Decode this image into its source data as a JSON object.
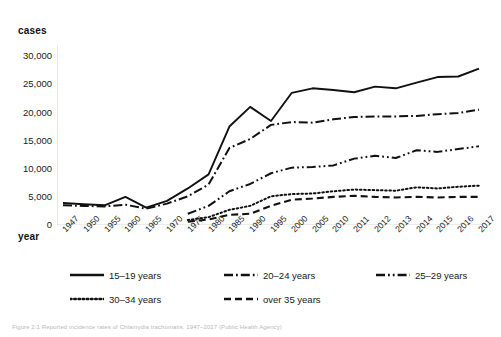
{
  "figure": {
    "caption": "Figure 2.1 Reported incidence rates of Chlamydia trachomatis, 1947–2017 (Public Health Agency)"
  },
  "axes": {
    "y_title": "cases",
    "x_title": "year",
    "y_ticks": [
      "30,000",
      "25,000",
      "20,000",
      "15,000",
      "10,000",
      "5,000",
      "0"
    ],
    "x_ticks": [
      "1947",
      "1950",
      "1955",
      "1960",
      "1965",
      "1970",
      "1975",
      "1980",
      "1985",
      "1990",
      "1995",
      "2000",
      "2005",
      "2010",
      "2011",
      "2012",
      "2013",
      "2014",
      "2015",
      "2016",
      "2017"
    ]
  },
  "legend": {
    "items": [
      {
        "label": "15–19 years",
        "style": "solid",
        "color": "#111111"
      },
      {
        "label": "20–24 years",
        "style": "dashdot",
        "color": "#111111"
      },
      {
        "label": "25–29 years",
        "style": "dashdotdot",
        "color": "#111111"
      },
      {
        "label": "30–34 years",
        "style": "dotted",
        "color": "#111111"
      },
      {
        "label": "over 35 years",
        "style": "dashed",
        "color": "#111111"
      }
    ]
  },
  "chart_data": {
    "type": "line",
    "title": "",
    "xlabel": "year",
    "ylabel": "cases",
    "ylim": [
      0,
      32000
    ],
    "grid": false,
    "legend_position": "bottom",
    "categories": [
      "1947",
      "1950",
      "1955",
      "1960",
      "1965",
      "1970",
      "1975",
      "1980",
      "1985",
      "1990",
      "1995",
      "2000",
      "2005",
      "2010",
      "2011",
      "2012",
      "2013",
      "2014",
      "2015",
      "2016",
      "2017"
    ],
    "series": [
      {
        "name": "15–19 years",
        "style": "solid",
        "color": "#111111",
        "values": [
          3900,
          3700,
          3500,
          5000,
          3100,
          4300,
          6500,
          9000,
          17500,
          21000,
          18500,
          23500,
          24300,
          24000,
          23600,
          24600,
          24300,
          25300,
          26300,
          26400,
          27800
        ]
      },
      {
        "name": "20–24 years",
        "style": "dashdot",
        "color": "#111111",
        "values": [
          3500,
          3400,
          3300,
          3600,
          2900,
          3800,
          5100,
          7200,
          13700,
          15300,
          17800,
          18300,
          18200,
          18800,
          19200,
          19300,
          19300,
          19400,
          19700,
          19900,
          20500
        ]
      },
      {
        "name": "25–29 years",
        "style": "dashdotdot",
        "color": "#111111",
        "values": [
          null,
          null,
          null,
          null,
          null,
          null,
          2000,
          3400,
          6000,
          7300,
          9200,
          10200,
          10300,
          10600,
          11800,
          12300,
          11900,
          13300,
          13000,
          13500,
          14000
        ]
      },
      {
        "name": "30–34 years",
        "style": "dotted",
        "color": "#111111",
        "values": [
          null,
          null,
          null,
          null,
          null,
          null,
          900,
          1400,
          2700,
          3400,
          5100,
          5500,
          5600,
          6000,
          6300,
          6200,
          6100,
          6700,
          6500,
          6800,
          7000
        ]
      },
      {
        "name": "over 35 years",
        "style": "dashed",
        "color": "#111111",
        "values": [
          null,
          null,
          null,
          null,
          null,
          null,
          600,
          1000,
          1800,
          2000,
          3400,
          4500,
          4700,
          5000,
          5200,
          5000,
          4900,
          5000,
          4900,
          5000,
          5000
        ]
      }
    ]
  }
}
